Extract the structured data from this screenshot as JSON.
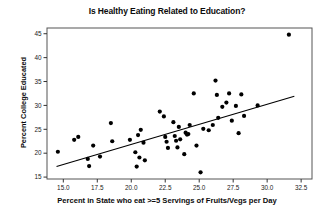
{
  "chart_data": {
    "type": "scatter",
    "title": "Is Healthy Eating Related to Education?",
    "xlabel": "Percent in State who eat >=5 Servings of Fruits/Vegs per Day",
    "ylabel": "Percent College Educated",
    "xlim": [
      13.8,
      33.3
    ],
    "ylim": [
      14.6,
      46.2
    ],
    "xticks": [
      15.0,
      17.5,
      20.0,
      22.5,
      25.0,
      27.5,
      30.0,
      32.5
    ],
    "xtick_labels": [
      "15.0",
      "17.5",
      "20.0",
      "22.5",
      "25.0",
      "27.5",
      "30.0",
      "32.5"
    ],
    "yticks": [
      15,
      20,
      25,
      30,
      35,
      40,
      45
    ],
    "ytick_labels": [
      "15",
      "20",
      "25",
      "30",
      "35",
      "40",
      "45"
    ],
    "grid": false,
    "legend": false,
    "marker_color": "#000000",
    "marker_size": 2.1,
    "line_color": "#000000",
    "points": [
      [
        14.6,
        20.3
      ],
      [
        15.8,
        22.8
      ],
      [
        16.1,
        23.4
      ],
      [
        16.8,
        18.8
      ],
      [
        16.9,
        17.3
      ],
      [
        17.2,
        21.6
      ],
      [
        17.7,
        19.3
      ],
      [
        18.5,
        26.3
      ],
      [
        18.6,
        22.5
      ],
      [
        19.9,
        22.8
      ],
      [
        20.3,
        20.2
      ],
      [
        20.4,
        17.2
      ],
      [
        20.5,
        23.8
      ],
      [
        20.6,
        19.1
      ],
      [
        20.7,
        24.9
      ],
      [
        20.9,
        22.2
      ],
      [
        21.0,
        18.5
      ],
      [
        22.1,
        28.7
      ],
      [
        22.4,
        27.7
      ],
      [
        22.5,
        23.4
      ],
      [
        22.6,
        22.4
      ],
      [
        22.7,
        21.1
      ],
      [
        23.1,
        26.5
      ],
      [
        23.2,
        23.6
      ],
      [
        23.3,
        22.6
      ],
      [
        23.4,
        21.2
      ],
      [
        23.5,
        25.5
      ],
      [
        23.6,
        22.9
      ],
      [
        23.9,
        19.8
      ],
      [
        24.0,
        24.3
      ],
      [
        24.1,
        23.9
      ],
      [
        24.2,
        24.0
      ],
      [
        24.3,
        25.9
      ],
      [
        24.6,
        32.5
      ],
      [
        24.8,
        21.6
      ],
      [
        25.1,
        16.0
      ],
      [
        25.3,
        25.1
      ],
      [
        25.7,
        24.8
      ],
      [
        26.0,
        25.9
      ],
      [
        26.2,
        35.2
      ],
      [
        26.3,
        32.2
      ],
      [
        26.4,
        27.4
      ],
      [
        26.7,
        29.7
      ],
      [
        27.0,
        30.6
      ],
      [
        27.2,
        32.5
      ],
      [
        27.4,
        26.8
      ],
      [
        27.7,
        29.9
      ],
      [
        27.9,
        24.2
      ],
      [
        28.1,
        32.3
      ],
      [
        28.3,
        27.8
      ],
      [
        29.3,
        30.0
      ],
      [
        31.6,
        44.8
      ]
    ],
    "fit_line": {
      "x": [
        14.5,
        32.0
      ],
      "y": [
        17.2,
        31.9
      ],
      "slope": 0.84,
      "intercept": 5.02
    }
  },
  "axes": {
    "title_label": "Is Healthy Eating Related to Education?",
    "y_title_label": "Percent College Educated",
    "x_title_label": "Percent in State who eat >=5 Servings of Fruits/Vegs per Day"
  }
}
